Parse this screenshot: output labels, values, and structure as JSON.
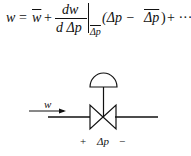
{
  "equation": {
    "lhs": "w",
    "equals": "=",
    "wbar": "w",
    "plus1": "+",
    "frac_num": "dw",
    "frac_den": "d Δp",
    "eval_sub": "Δp",
    "paren_open": "(Δp − ",
    "dpbar": "Δp",
    "paren_close": ")",
    "tail": "+ ···"
  },
  "diagram": {
    "flow_label": "w",
    "plus_label": "+",
    "dp_label": "Δp",
    "minus_label": "−",
    "elements": [
      "flow-arrow",
      "pipe",
      "control-valve-body",
      "valve-stem",
      "diaphragm-actuator"
    ]
  }
}
